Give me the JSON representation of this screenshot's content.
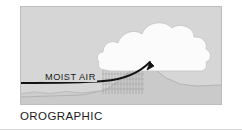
{
  "figure": {
    "caption": "OROGRAPHIC",
    "panel": {
      "background_color": "#d6d6d6",
      "border_color": "#bdbdbd"
    }
  },
  "diagram": {
    "title": "OROGRAPHIC",
    "type": "orographic-lifting-weather-diagram",
    "labels": {
      "moist_air": "MOIST AIR"
    },
    "elements": {
      "sky_label": "sky",
      "cloud_label": "cumulus cloud",
      "mountain_label": "mountain slope",
      "rain_label": "precipitation",
      "airflow_label": "moist air flow arrow",
      "ground_label": "foreground ground line"
    },
    "colors": {
      "sky": "#d6d6d6",
      "cloud": "#fbfbfb",
      "cloud_outline": "#c4c4c4",
      "mountain": "#cfcfcf",
      "mountain_outline": "#b3b3b3",
      "rain": "#9a9a9a",
      "arrow": "#121212",
      "text": "#1a1a1a",
      "ground_line": "#b8b8b8"
    },
    "geometry": {
      "panel_width": 202,
      "panel_height": 99,
      "arrow_start_x": 0,
      "arrow_start_y": 76,
      "arrow_tip_x": 135,
      "arrow_tip_y": 54,
      "rain_band_left": 82,
      "rain_band_right": 124,
      "rain_band_top": 62,
      "rain_band_bottom": 88
    }
  }
}
